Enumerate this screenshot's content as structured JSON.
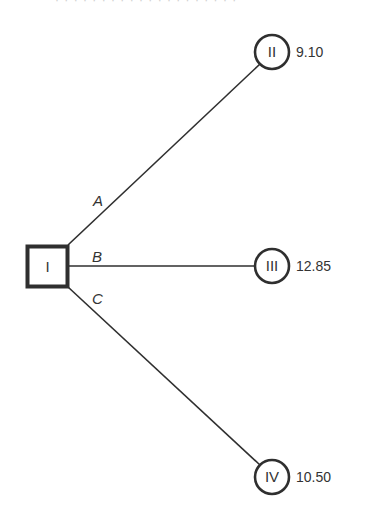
{
  "diagram": {
    "type": "decision-tree",
    "root": {
      "id": "I",
      "shape": "square",
      "label": "I",
      "cx": 47,
      "cy": 266,
      "size": 42
    },
    "nodes": [
      {
        "id": "II",
        "shape": "circle",
        "label": "II",
        "value": "9.10",
        "cx": 272,
        "cy": 52,
        "r": 17
      },
      {
        "id": "III",
        "shape": "circle",
        "label": "III",
        "value": "12.85",
        "cx": 272,
        "cy": 266,
        "r": 17
      },
      {
        "id": "IV",
        "shape": "circle",
        "label": "IV",
        "value": "10.50",
        "cx": 272,
        "cy": 477,
        "r": 17
      }
    ],
    "edges": [
      {
        "label": "A",
        "from": "I",
        "to": "II",
        "x1": 68,
        "y1": 245,
        "x2": 260,
        "y2": 64,
        "lx": 93,
        "ly": 206
      },
      {
        "label": "B",
        "from": "I",
        "to": "III",
        "x1": 68,
        "y1": 266,
        "x2": 255,
        "y2": 266,
        "lx": 92,
        "ly": 262
      },
      {
        "label": "C",
        "from": "I",
        "to": "IV",
        "x1": 68,
        "y1": 287,
        "x2": 260,
        "y2": 465,
        "lx": 92,
        "ly": 304
      }
    ],
    "colors": {
      "stroke": "#2f2f2f",
      "background": "#ffffff"
    }
  },
  "header_fragment": "· · ·  ·  ·  ·  · ·  · ·  ·   · · · ·  ·  ·  · · ·"
}
